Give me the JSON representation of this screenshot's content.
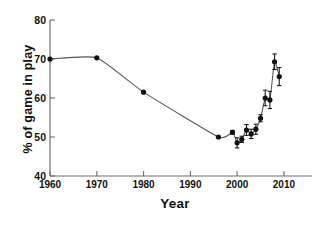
{
  "chart_data": {
    "type": "line",
    "title": "",
    "xlabel": "Year",
    "ylabel": "% of game in play",
    "xlim": [
      1960,
      2016
    ],
    "ylim": [
      40,
      80
    ],
    "xticks": [
      1960,
      1970,
      1980,
      1990,
      2000,
      2010
    ],
    "yticks": [
      40,
      50,
      60,
      70,
      80
    ],
    "grid": false,
    "legend": false,
    "marker": "filled-circle",
    "errorbars": true,
    "series": [
      {
        "name": "% of game in play",
        "points": [
          {
            "x": 1960,
            "y": 70.0,
            "err": 0
          },
          {
            "x": 1970,
            "y": 70.3,
            "err": 0
          },
          {
            "x": 1980,
            "y": 61.5,
            "err": 0
          },
          {
            "x": 1996,
            "y": 50.0,
            "err": 0
          },
          {
            "x": 1999,
            "y": 51.2,
            "err": 0.5
          },
          {
            "x": 2000,
            "y": 48.5,
            "err": 1.3
          },
          {
            "x": 2001,
            "y": 49.4,
            "err": 0.8
          },
          {
            "x": 2002,
            "y": 51.8,
            "err": 1.4
          },
          {
            "x": 2003,
            "y": 50.8,
            "err": 1.2
          },
          {
            "x": 2004,
            "y": 52.0,
            "err": 1.3
          },
          {
            "x": 2005,
            "y": 54.8,
            "err": 0.9
          },
          {
            "x": 2006,
            "y": 60.0,
            "err": 2.0
          },
          {
            "x": 2007,
            "y": 59.5,
            "err": 2.2
          },
          {
            "x": 2008,
            "y": 69.3,
            "err": 2.0
          },
          {
            "x": 2009,
            "y": 65.5,
            "err": 2.3
          }
        ]
      }
    ]
  }
}
